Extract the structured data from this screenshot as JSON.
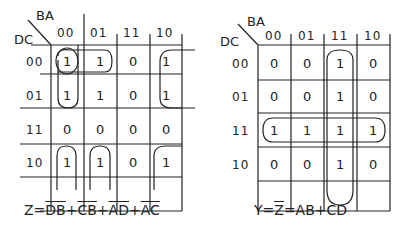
{
  "left_map": {
    "corner_col_var": "BA",
    "corner_row_var": "DC",
    "col_headers": [
      "00",
      "01",
      "11",
      "10"
    ],
    "row_headers": [
      "00",
      "01",
      "11",
      "10"
    ],
    "cells": [
      [
        "1",
        "1",
        "0",
        "1"
      ],
      [
        "1",
        "1",
        "0",
        "1"
      ],
      [
        "0",
        "0",
        "0",
        "0"
      ],
      [
        "1",
        "1",
        "0",
        "1"
      ]
    ],
    "equation": {
      "prefix": "Z=",
      "terms": [
        {
          "a": "D",
          "b": "B",
          "neg_a": true,
          "neg_b": true
        },
        {
          "a": "C",
          "b": "B",
          "neg_a": true,
          "neg_b": true
        },
        {
          "a": "A",
          "b": "D",
          "neg_a": true,
          "neg_b": true
        },
        {
          "a": "A",
          "b": "C",
          "neg_a": true,
          "neg_b": true
        }
      ],
      "text": "Z = D̄B̄ + C̄B̄ + ĀD̄ + ĀC̄"
    }
  },
  "right_map": {
    "corner_col_var": "BA",
    "corner_row_var": "DC",
    "col_headers": [
      "00",
      "01",
      "11",
      "10"
    ],
    "row_headers": [
      "00",
      "01",
      "11",
      "10"
    ],
    "cells": [
      [
        "0",
        "0",
        "1",
        "0"
      ],
      [
        "0",
        "0",
        "1",
        "0"
      ],
      [
        "1",
        "1",
        "1",
        "1"
      ],
      [
        "0",
        "0",
        "1",
        "0"
      ]
    ],
    "equation": {
      "y": "Y=",
      "zbar": "Z",
      "rest": "=AB+CD",
      "text": "Y = Z̄ = AB + CD"
    }
  }
}
